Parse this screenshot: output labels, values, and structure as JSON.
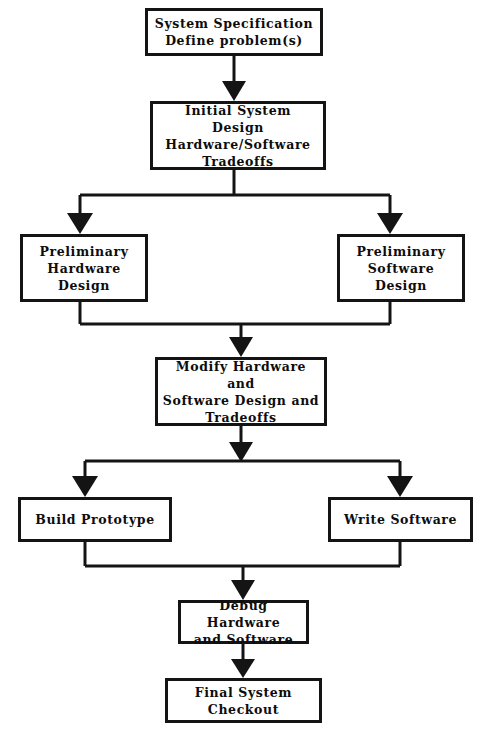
{
  "diagram": {
    "type": "flowchart",
    "background_color": "#ffffff",
    "line_color": "#141414",
    "text_color": "#0d0d0d",
    "nodes": [
      {
        "id": "spec",
        "label": "System  Specification\nDefine  problem(s)"
      },
      {
        "id": "initial",
        "label": "Initial  System  Design\nHardware/Software\nTradeoffs"
      },
      {
        "id": "prelim_hw",
        "label": "Preliminary\nHardware\nDesign"
      },
      {
        "id": "prelim_sw",
        "label": "Preliminary\nSoftware\nDesign"
      },
      {
        "id": "modify",
        "label": "Modify Hardware  and\nSoftware  Design  and\nTradeoffs"
      },
      {
        "id": "build",
        "label": "Build  Prototype"
      },
      {
        "id": "write",
        "label": "Write  Software"
      },
      {
        "id": "debug",
        "label": "Debug  Hardware\nand  Software"
      },
      {
        "id": "final",
        "label": "Final  System\nCheckout"
      }
    ],
    "edges": [
      {
        "from": "spec",
        "to": "initial",
        "kind": "straight-down"
      },
      {
        "from": "initial",
        "to": "prelim_hw",
        "kind": "split-left"
      },
      {
        "from": "initial",
        "to": "prelim_sw",
        "kind": "split-right"
      },
      {
        "from": "prelim_hw",
        "to": "modify",
        "kind": "merge-left"
      },
      {
        "from": "prelim_sw",
        "to": "modify",
        "kind": "merge-right"
      },
      {
        "from": "modify",
        "to": "build",
        "kind": "split-left"
      },
      {
        "from": "modify",
        "to": "write",
        "kind": "split-right"
      },
      {
        "from": "build",
        "to": "debug",
        "kind": "merge-left"
      },
      {
        "from": "write",
        "to": "debug",
        "kind": "merge-right"
      },
      {
        "from": "debug",
        "to": "final",
        "kind": "straight-down"
      }
    ]
  }
}
